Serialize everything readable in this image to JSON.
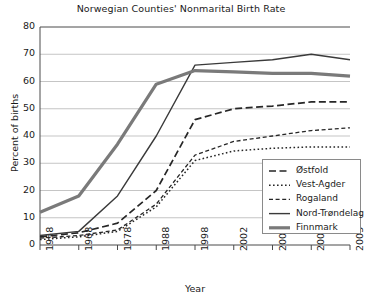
{
  "chart_data": {
    "type": "line",
    "title": "Norwegian Counties' Nonmarital Birth Rate",
    "xlabel": "Year",
    "ylabel": "Percent of births",
    "categories": [
      "1958",
      "1968",
      "1978",
      "1988",
      "1998",
      "2002",
      "2003",
      "2004",
      "2005"
    ],
    "ylim": [
      0,
      80
    ],
    "yticks": [
      0,
      10,
      20,
      30,
      40,
      50,
      60,
      70,
      80
    ],
    "grid": "horizontal",
    "legend_position": "inside-bottom-right",
    "series": [
      {
        "name": "Østfold",
        "style": "dashed",
        "color": "#262626",
        "width": 1.7,
        "values": [
          3.0,
          4.5,
          8.0,
          20.0,
          46.0,
          50.0,
          51.0,
          52.5,
          52.5
        ]
      },
      {
        "name": "Vest-Agder",
        "style": "dotted",
        "color": "#262626",
        "width": 1.5,
        "values": [
          2.0,
          3.0,
          5.0,
          14.0,
          31.0,
          34.5,
          35.5,
          36.0,
          36.0
        ]
      },
      {
        "name": "Rogaland",
        "style": "dash-dot",
        "color": "#262626",
        "width": 1.3,
        "values": [
          2.5,
          3.5,
          5.5,
          15.0,
          33.0,
          38.0,
          40.0,
          42.0,
          43.0
        ]
      },
      {
        "name": "Nord-Trøndelag",
        "style": "solid",
        "color": "#3a3a3a",
        "width": 1.4,
        "values": [
          3.5,
          5.0,
          18.0,
          40.0,
          66.0,
          67.0,
          68.0,
          70.0,
          68.0
        ]
      },
      {
        "name": "Finnmark",
        "style": "solid-thick",
        "color": "#7a7a7a",
        "width": 3.2,
        "values": [
          12.0,
          18.0,
          37.0,
          59.0,
          64.0,
          63.5,
          63.0,
          63.0,
          62.0
        ]
      }
    ]
  },
  "plot": {
    "left": 40,
    "right": 350,
    "top": 27,
    "bottom": 245
  },
  "legend": {
    "items": [
      {
        "label": "Østfold"
      },
      {
        "label": "Vest-Agder"
      },
      {
        "label": "Rogaland"
      },
      {
        "label": "Nord-Trøndelag"
      },
      {
        "label": "Finnmark"
      }
    ]
  }
}
